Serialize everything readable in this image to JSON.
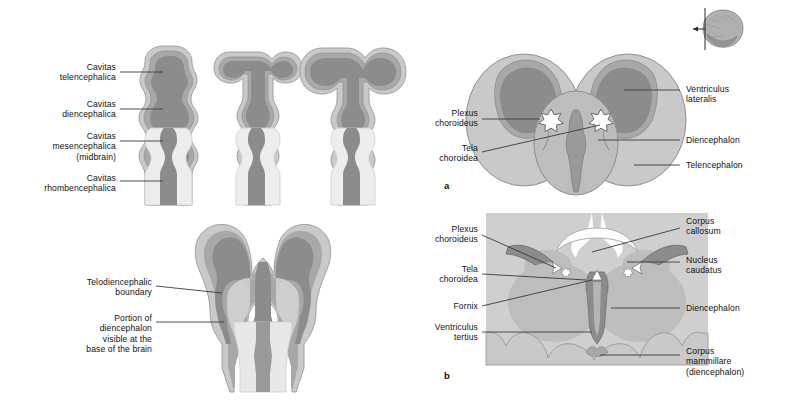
{
  "figure": {
    "type": "anatomical-diagram",
    "background": "#ffffff"
  },
  "palette": {
    "cavity_dark": "#8c8c8c",
    "wall_mid": "#a8a8a8",
    "wall_light": "#c9c9c9",
    "tissue_light": "#bdbdbd",
    "tissue_lighter": "#d2d2d2",
    "panel_b_bg": "#cfcfcf",
    "white": "#ffffff",
    "outline": "#6b6b6b",
    "leader": "#3a3a3a",
    "text": "#111111"
  },
  "top_left_panel": {
    "name": "ventricular-system-development-series",
    "stages": 3,
    "labels": [
      {
        "id": "cavitas-telencephalica",
        "lines": [
          "Cavitas",
          "telencephalica"
        ],
        "x": 12,
        "y": 62,
        "w": 104,
        "leader_to_x": 163,
        "leader_y": 72
      },
      {
        "id": "cavitas-diencephalica",
        "lines": [
          "Cavitas",
          "diencephalica"
        ],
        "x": 12,
        "y": 99,
        "w": 104,
        "leader_to_x": 163,
        "leader_y": 109
      },
      {
        "id": "cavitas-mesencephalica",
        "lines": [
          "Cavitas",
          "mesencephalica",
          "(midbrain)"
        ],
        "x": 12,
        "y": 131,
        "w": 104,
        "leader_to_x": 163,
        "leader_y": 141
      },
      {
        "id": "cavitas-rhombencephalica",
        "lines": [
          "Cavitas",
          "rhombencephalica"
        ],
        "x": 8,
        "y": 173,
        "w": 108,
        "leader_to_x": 163,
        "leader_y": 181
      }
    ]
  },
  "bottom_left_panel": {
    "name": "telodiencephalic-boundary-diagram",
    "labels": [
      {
        "id": "telodiencephalic-boundary",
        "lines": [
          "Telodiencephalic",
          "boundary"
        ],
        "x": 56,
        "y": 277,
        "w": 96,
        "leader_to_x": 222,
        "leader_y": 293
      },
      {
        "id": "portion-of-diencephalon",
        "lines": [
          "Portion of",
          "diencephalon",
          "visible at the",
          "base of the brain"
        ],
        "x": 54,
        "y": 317,
        "w": 98,
        "leader_to_x": 224,
        "leader_y": 322
      }
    ]
  },
  "panel_a": {
    "id_label": "a",
    "name": "transverse-section-embryonic-brain",
    "labels_right": [
      {
        "id": "ventriculus-lateralis",
        "lines": [
          "Ventriculus",
          "lateralis"
        ],
        "x": 686,
        "y": 84,
        "leader_from_x": 680,
        "leader_to_x": 624,
        "leader_y": 90
      },
      {
        "id": "diencephalon",
        "lines": [
          "Diencephalon"
        ],
        "x": 686,
        "y": 136,
        "leader_from_x": 680,
        "leader_to_x": 598,
        "leader_y": 140
      },
      {
        "id": "telencephalon",
        "lines": [
          "Telencephalon"
        ],
        "x": 686,
        "y": 161,
        "leader_from_x": 680,
        "leader_to_x": 634,
        "leader_y": 165
      }
    ],
    "labels_left": [
      {
        "id": "plexus-choroideus",
        "lines": [
          "Plexus",
          "choroideus"
        ],
        "x": 414,
        "y": 113,
        "w": 64,
        "leader_to_x": 547,
        "leader_y": 120
      },
      {
        "id": "tela-choroidea",
        "lines": [
          "Tela",
          "choroidea"
        ],
        "x": 414,
        "y": 148,
        "w": 64,
        "leader_to_x": 546,
        "leader_y": 133
      }
    ]
  },
  "panel_b": {
    "id_label": "b",
    "name": "coronal-section-adult-brain",
    "labels_right": [
      {
        "id": "corpus-callosum",
        "lines": [
          "Corpus",
          "callosum"
        ],
        "x": 686,
        "y": 216,
        "leader_from_x": 680,
        "leader_to_x": 592,
        "leader_y": 252
      },
      {
        "id": "nucleus-caudatus",
        "lines": [
          "Nucleus",
          "caudatus"
        ],
        "x": 686,
        "y": 256,
        "leader_from_x": 680,
        "leader_to_x": 627,
        "leader_y": 261
      },
      {
        "id": "diencephalon",
        "lines": [
          "Diencephalon"
        ],
        "x": 686,
        "y": 304,
        "leader_from_x": 680,
        "leader_to_x": 611,
        "leader_y": 308
      },
      {
        "id": "corpus-mammillare",
        "lines": [
          "Corpus",
          "mammillare",
          "(diencephalon)"
        ],
        "x": 686,
        "y": 350,
        "leader_from_x": 680,
        "leader_to_x": 583,
        "leader_y": 355
      }
    ],
    "labels_left": [
      {
        "id": "plexus-choroideus",
        "lines": [
          "Plexus",
          "choroideus"
        ],
        "x": 412,
        "y": 228,
        "w": 66,
        "leader_to_x": 545,
        "leader_y": 268
      },
      {
        "id": "tela-choroidea",
        "lines": [
          "Tela",
          "choroidea"
        ],
        "x": 412,
        "y": 268,
        "w": 66,
        "leader_to_x": 542,
        "leader_y": 275
      },
      {
        "id": "fornix",
        "lines": [
          "Fornix"
        ],
        "x": 412,
        "y": 303,
        "w": 66,
        "leader_to_x": 540,
        "leader_y": 277
      },
      {
        "id": "ventriculus-tertius",
        "lines": [
          "Ventriculus",
          "tertius"
        ],
        "x": 408,
        "y": 326,
        "w": 70,
        "leader_to_x": 570,
        "leader_y": 332
      }
    ]
  },
  "orientation_thumbnail": {
    "name": "brain-orientation-thumbnail",
    "description": "lateral view of brain with coronal section plane and arrow",
    "x": 693,
    "y": 8,
    "w": 52,
    "h": 42
  }
}
